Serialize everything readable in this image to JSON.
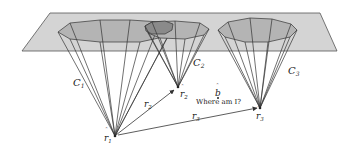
{
  "diagram": {
    "colors": {
      "plane_fill": "#d4d4d4",
      "plane_stroke": "#555555",
      "ellipse_fill": "#b4b4b4",
      "ellipse_overlap_fill": "#8a8a8a",
      "line": "#333333",
      "text": "#222222"
    },
    "cones": [
      {
        "id": "C1",
        "label": "C",
        "subscript": "1",
        "apex_label": "r",
        "apex_subscript": "1"
      },
      {
        "id": "C2",
        "label": "C",
        "subscript": "2",
        "apex_label": "r",
        "apex_subscript": "2"
      },
      {
        "id": "C3",
        "label": "C",
        "subscript": "3",
        "apex_label": "r",
        "apex_subscript": "3"
      }
    ],
    "vectors": [
      {
        "from": "r1",
        "to": "r2",
        "label": "r",
        "subscript": "2"
      },
      {
        "from": "r1",
        "to": "r3",
        "label": "r",
        "subscript": "3"
      }
    ],
    "point_b": {
      "label": "b",
      "caption": "Where am I?"
    }
  }
}
